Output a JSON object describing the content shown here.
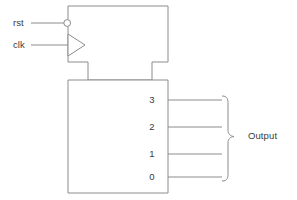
{
  "diagram": {
    "type": "digital-logic-block-diagram",
    "background_color": "#ffffff",
    "line_color": "#8c8c8c",
    "text_color": "#3a3a3a",
    "inputs": [
      {
        "label": "rst",
        "icon": "inversion-bubble",
        "description": "active-low reset input",
        "x": 13,
        "y": 18
      },
      {
        "label": "clk",
        "icon": "clock-triangle",
        "description": "clock input",
        "x": 13,
        "y": 40
      }
    ],
    "blocks": [
      {
        "name": "control-block",
        "label": "",
        "x": 68,
        "y": 6,
        "width": 100,
        "height": 56
      },
      {
        "name": "counter-block",
        "label": "",
        "x": 68,
        "y": 80,
        "width": 100,
        "height": 113
      }
    ],
    "output_pins": [
      {
        "label": "3",
        "y": 100
      },
      {
        "label": "2",
        "y": 127
      },
      {
        "label": "1",
        "y": 154
      },
      {
        "label": "0",
        "y": 177
      }
    ],
    "output_group": {
      "label": "Output",
      "brace": "right-curly-brace",
      "label_x": 248,
      "label_y": 129
    }
  }
}
